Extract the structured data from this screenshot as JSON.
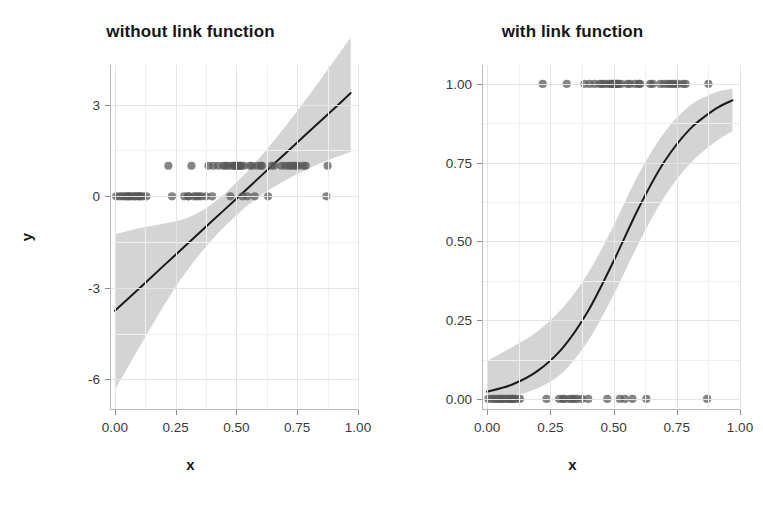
{
  "figure": {
    "background": "#ffffff",
    "ribbon_color": "#d4d4d4",
    "line_color": "#1a1a1a",
    "point_color": "#565656",
    "grid_color": "#e3e3ea"
  },
  "panels": [
    {
      "id": "without-link-function",
      "title": "without link function",
      "xlabel": "x",
      "ylabel": "y",
      "xticks": [
        "0.00",
        "0.25",
        "0.50",
        "0.75",
        "1.00"
      ],
      "xtick_values": [
        0.0,
        0.25,
        0.5,
        0.75,
        1.0
      ],
      "yticks": [
        "-6",
        "-3",
        "0",
        "3"
      ],
      "ytick_values": [
        -6,
        -3,
        0,
        3
      ]
    },
    {
      "id": "with-link-function",
      "title": "with link function",
      "xlabel": "x",
      "ylabel": "y",
      "xticks": [
        "0.00",
        "0.25",
        "0.50",
        "0.75",
        "1.00"
      ],
      "xtick_values": [
        0.0,
        0.25,
        0.5,
        0.75,
        1.0
      ],
      "yticks": [
        "0.00",
        "0.25",
        "0.50",
        "0.75",
        "1.00"
      ],
      "ytick_values": [
        0.0,
        0.25,
        0.5,
        0.75,
        1.0
      ]
    }
  ],
  "chart_data": [
    {
      "type": "scatter",
      "title": "without link function",
      "xlabel": "x",
      "ylabel": "y",
      "xlim": [
        -0.02,
        1.0
      ],
      "ylim": [
        -7.0,
        4.3
      ],
      "grid": true,
      "legend": "none",
      "description": "Linear (identity link) fit to binary 0/1 outcome data with 95% confidence ribbon. Fitted line extends below 0 and above 1, which is implausible for probabilities.",
      "series": [
        {
          "name": "observations",
          "kind": "points",
          "x": [
            0.005,
            0.02,
            0.03,
            0.04,
            0.05,
            0.055,
            0.06,
            0.07,
            0.08,
            0.085,
            0.095,
            0.1,
            0.105,
            0.115,
            0.13,
            0.22,
            0.235,
            0.285,
            0.3,
            0.305,
            0.315,
            0.325,
            0.335,
            0.345,
            0.355,
            0.375,
            0.385,
            0.4,
            0.405,
            0.425,
            0.445,
            0.455,
            0.465,
            0.475,
            0.48,
            0.49,
            0.495,
            0.5,
            0.505,
            0.51,
            0.515,
            0.52,
            0.525,
            0.53,
            0.545,
            0.555,
            0.565,
            0.575,
            0.585,
            0.6,
            0.605,
            0.63,
            0.645,
            0.655,
            0.685,
            0.7,
            0.715,
            0.725,
            0.735,
            0.745,
            0.755,
            0.775,
            0.785,
            0.87,
            0.875
          ],
          "y": [
            0,
            0,
            0,
            0,
            0,
            0,
            0,
            0,
            0,
            0,
            0,
            0,
            0,
            0,
            0,
            1,
            0,
            0,
            0,
            0,
            1,
            0,
            0,
            0,
            0,
            0,
            1,
            0,
            1,
            1,
            1,
            1,
            1,
            0,
            1,
            1,
            1,
            1,
            1,
            1,
            1,
            1,
            0,
            1,
            0,
            1,
            1,
            0,
            1,
            1,
            1,
            0,
            1,
            1,
            1,
            1,
            1,
            1,
            1,
            1,
            1,
            1,
            1,
            0,
            1
          ]
        },
        {
          "name": "linear fit",
          "kind": "line",
          "x": [
            0.0,
            0.1,
            0.2,
            0.3,
            0.4,
            0.5,
            0.6,
            0.7,
            0.8,
            0.9,
            0.97
          ],
          "y": [
            -3.75,
            -3.02,
            -2.28,
            -1.55,
            -0.81,
            -0.08,
            0.66,
            1.39,
            2.13,
            2.86,
            3.38
          ]
        },
        {
          "name": "confidence ribbon",
          "kind": "ribbon",
          "x": [
            0.0,
            0.1,
            0.2,
            0.3,
            0.4,
            0.5,
            0.6,
            0.7,
            0.8,
            0.9,
            0.97
          ],
          "ymin": [
            -6.35,
            -4.95,
            -3.6,
            -2.4,
            -1.42,
            -0.62,
            0.03,
            0.52,
            0.92,
            1.25,
            1.45
          ],
          "ymax": [
            -1.25,
            -1.05,
            -0.9,
            -0.7,
            -0.25,
            0.45,
            1.3,
            2.28,
            3.32,
            4.42,
            5.2
          ]
        }
      ]
    },
    {
      "type": "scatter",
      "title": "with link function",
      "xlabel": "x",
      "ylabel": "y",
      "xlim": [
        -0.02,
        1.0
      ],
      "ylim": [
        -0.035,
        1.06
      ],
      "grid": true,
      "legend": "none",
      "description": "Logistic (logit link) fit to the same binary 0/1 outcome data with 95% confidence ribbon. The S-shaped curve stays bounded within 0 and 1.",
      "series": [
        {
          "name": "observations",
          "kind": "points",
          "x": [
            0.005,
            0.02,
            0.03,
            0.04,
            0.05,
            0.055,
            0.06,
            0.07,
            0.08,
            0.085,
            0.095,
            0.1,
            0.105,
            0.115,
            0.13,
            0.22,
            0.235,
            0.285,
            0.3,
            0.305,
            0.315,
            0.325,
            0.335,
            0.345,
            0.355,
            0.375,
            0.385,
            0.4,
            0.405,
            0.425,
            0.445,
            0.455,
            0.465,
            0.475,
            0.48,
            0.49,
            0.495,
            0.5,
            0.505,
            0.51,
            0.515,
            0.52,
            0.525,
            0.53,
            0.545,
            0.555,
            0.565,
            0.575,
            0.585,
            0.6,
            0.605,
            0.63,
            0.645,
            0.655,
            0.685,
            0.7,
            0.715,
            0.725,
            0.735,
            0.745,
            0.755,
            0.775,
            0.785,
            0.87,
            0.875
          ],
          "y": [
            0,
            0,
            0,
            0,
            0,
            0,
            0,
            0,
            0,
            0,
            0,
            0,
            0,
            0,
            0,
            1,
            0,
            0,
            0,
            0,
            1,
            0,
            0,
            0,
            0,
            0,
            1,
            0,
            1,
            1,
            1,
            1,
            1,
            0,
            1,
            1,
            1,
            1,
            1,
            1,
            1,
            1,
            0,
            1,
            0,
            1,
            1,
            0,
            1,
            1,
            1,
            0,
            1,
            1,
            1,
            1,
            1,
            1,
            1,
            1,
            1,
            1,
            1,
            0,
            1
          ]
        },
        {
          "name": "logistic fit",
          "kind": "line",
          "x": [
            0.0,
            0.1,
            0.2,
            0.3,
            0.4,
            0.5,
            0.6,
            0.7,
            0.8,
            0.9,
            0.97
          ],
          "y": [
            0.023,
            0.046,
            0.089,
            0.163,
            0.28,
            0.437,
            0.607,
            0.752,
            0.855,
            0.919,
            0.948
          ]
        },
        {
          "name": "confidence ribbon",
          "kind": "ribbon",
          "x": [
            0.0,
            0.1,
            0.2,
            0.3,
            0.4,
            0.5,
            0.6,
            0.7,
            0.8,
            0.9,
            0.97
          ],
          "ymin": [
            0.002,
            0.01,
            0.034,
            0.085,
            0.185,
            0.33,
            0.495,
            0.64,
            0.745,
            0.815,
            0.85
          ],
          "ymax": [
            0.12,
            0.165,
            0.215,
            0.29,
            0.4,
            0.55,
            0.715,
            0.845,
            0.93,
            0.972,
            0.985
          ]
        }
      ]
    }
  ]
}
